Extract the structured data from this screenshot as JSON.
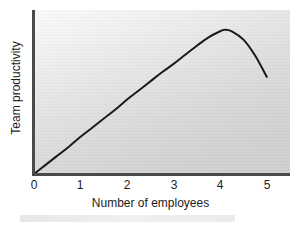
{
  "chart_data": {
    "type": "line",
    "title": "",
    "subtitle": "",
    "xlabel": "Number of employees",
    "ylabel": "Team productivity",
    "xlim": [
      0,
      5.5
    ],
    "ylim": [
      0,
      1.08
    ],
    "xticks": [
      "0",
      "1",
      "2",
      "3",
      "4",
      "5"
    ],
    "xtick_values": [
      0,
      1,
      2,
      3,
      4,
      5
    ],
    "yticks": [],
    "grid": false,
    "legend": null,
    "annotations": [],
    "series": [
      {
        "name": "Team productivity",
        "color": "#1a1a1a",
        "line_width": 2,
        "x": [
          0,
          0.25,
          0.5,
          0.75,
          1.0,
          1.25,
          1.5,
          1.75,
          2.0,
          2.25,
          2.5,
          2.75,
          3.0,
          3.25,
          3.5,
          3.75,
          4.0,
          4.1,
          4.25,
          4.5,
          4.75,
          5.0
        ],
        "y": [
          0.0,
          0.06,
          0.12,
          0.18,
          0.245,
          0.305,
          0.365,
          0.425,
          0.49,
          0.55,
          0.61,
          0.67,
          0.725,
          0.785,
          0.845,
          0.9,
          0.94,
          0.95,
          0.94,
          0.885,
          0.78,
          0.64
        ]
      }
    ]
  },
  "axis": {
    "x_title": "Number of employees",
    "y_title": "Team productivity",
    "x_tick_labels": [
      "0",
      "1",
      "2",
      "3",
      "4",
      "5"
    ]
  },
  "colors": {
    "curve": "#1a1a1a",
    "axis": "#4a4a4a",
    "panel_light": "#fbfbfb",
    "panel_dark": "#cfcfcf",
    "text": "#1c1c1c",
    "page_background": "#ffffff"
  }
}
